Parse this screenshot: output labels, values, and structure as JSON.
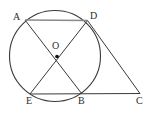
{
  "figure": {
    "background_color": "#ffffff",
    "stroke_color": "#3a3a3a",
    "chord_ad_color": "#8a8a8a",
    "label_color": "#2b2b2b",
    "width": 155,
    "height": 113
  },
  "circle": {
    "name": "main-circle",
    "center_x": 55,
    "center_y": 56,
    "radius": 45.5,
    "center_label": "O",
    "center_dot_radius": 1.8
  },
  "points": [
    {
      "id": "A",
      "label": "A",
      "x": 25.0,
      "y": 20.0,
      "label_x": 13,
      "label_y": 12
    },
    {
      "id": "D",
      "label": "D",
      "x": 87.5,
      "y": 20.5,
      "label_x": 90,
      "label_y": 11
    },
    {
      "id": "O",
      "label": "O",
      "x": 57.0,
      "y": 56.5,
      "label_x": 52,
      "label_y": 41
    },
    {
      "id": "E",
      "label": "E",
      "x": 30.0,
      "y": 94.0,
      "label_x": 26,
      "label_y": 96
    },
    {
      "id": "B",
      "label": "B",
      "x": 82.0,
      "y": 94.0,
      "label_x": 78,
      "label_y": 96
    },
    {
      "id": "C",
      "label": "C",
      "x": 140.0,
      "y": 93.5,
      "label_x": 136,
      "label_y": 96
    }
  ],
  "segments": [
    {
      "name": "chord-AD",
      "from": "A",
      "to": "D",
      "x1": 25.0,
      "y1": 20.0,
      "x2": 87.5,
      "y2": 20.5,
      "color": "#8a8a8a",
      "width": 1.6
    },
    {
      "name": "chord-AB",
      "from": "A",
      "to": "B",
      "x1": 25.0,
      "y1": 20.0,
      "x2": 82.0,
      "y2": 94.0,
      "color": "#3a3a3a",
      "width": 1.0
    },
    {
      "name": "chord-DE",
      "from": "D",
      "to": "E",
      "x1": 87.5,
      "y1": 20.5,
      "x2": 30.0,
      "y2": 94.0,
      "color": "#3a3a3a",
      "width": 1.0
    },
    {
      "name": "line-EC",
      "from": "E",
      "to": "C",
      "x1": 30.0,
      "y1": 94.0,
      "x2": 140.0,
      "y2": 93.5,
      "color": "#3a3a3a",
      "width": 1.0
    },
    {
      "name": "line-DC",
      "from": "D",
      "to": "C",
      "x1": 87.5,
      "y1": 20.5,
      "x2": 140.0,
      "y2": 93.5,
      "color": "#3a3a3a",
      "width": 1.0
    }
  ]
}
